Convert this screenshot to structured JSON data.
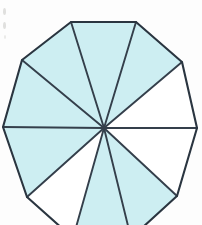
{
  "figure": {
    "name": "shaded-decagon-fraction-diagram",
    "shape_name": "decagon",
    "sides": 10,
    "total_sectors": 10,
    "shaded_sectors": 7,
    "unshaded_sectors": 3,
    "fraction_shaded": "7/10",
    "center": {
      "x": 104,
      "y": 128
    },
    "colors": {
      "shaded_fill": "#cdeef2",
      "unshaded_fill": "#ffffff",
      "outline": "#2a3540",
      "spoke": "#343f4b",
      "background": "#fdfdfd",
      "artifact": "#c8c8c4"
    },
    "stroke_widths": {
      "edge": 2.1,
      "spoke": 1.9
    },
    "vertices": [
      {
        "index": 0,
        "label": "top-left",
        "x": 71,
        "y": 22
      },
      {
        "index": 1,
        "label": "top-right",
        "x": 136,
        "y": 22
      },
      {
        "index": 2,
        "label": "upper-right",
        "x": 182,
        "y": 62
      },
      {
        "index": 3,
        "label": "right",
        "x": 197,
        "y": 128
      },
      {
        "index": 4,
        "label": "lower-right",
        "x": 177,
        "y": 196
      },
      {
        "index": 5,
        "label": "bottom-right",
        "x": 131,
        "y": 238
      },
      {
        "index": 6,
        "label": "bottom-left",
        "x": 73,
        "y": 238
      },
      {
        "index": 7,
        "label": "lower-left",
        "x": 27,
        "y": 197
      },
      {
        "index": 8,
        "label": "left",
        "x": 3,
        "y": 127
      },
      {
        "index": 9,
        "label": "upper-left",
        "x": 22,
        "y": 60
      }
    ],
    "sectors": [
      {
        "index": 0,
        "name": "sector-top",
        "from": 0,
        "to": 1,
        "shaded": true
      },
      {
        "index": 1,
        "name": "sector-upper-right",
        "from": 1,
        "to": 2,
        "shaded": true
      },
      {
        "index": 2,
        "name": "sector-right-upper",
        "from": 2,
        "to": 3,
        "shaded": false
      },
      {
        "index": 3,
        "name": "sector-right-lower",
        "from": 3,
        "to": 4,
        "shaded": false
      },
      {
        "index": 4,
        "name": "sector-lower-right",
        "from": 4,
        "to": 5,
        "shaded": true
      },
      {
        "index": 5,
        "name": "sector-bottom",
        "from": 5,
        "to": 6,
        "shaded": true
      },
      {
        "index": 6,
        "name": "sector-lower-left",
        "from": 6,
        "to": 7,
        "shaded": false
      },
      {
        "index": 7,
        "name": "sector-left-lower",
        "from": 7,
        "to": 8,
        "shaded": true
      },
      {
        "index": 8,
        "name": "sector-left-upper",
        "from": 8,
        "to": 9,
        "shaded": true
      },
      {
        "index": 9,
        "name": "sector-upper-left",
        "from": 9,
        "to": 0,
        "shaded": true
      }
    ]
  }
}
